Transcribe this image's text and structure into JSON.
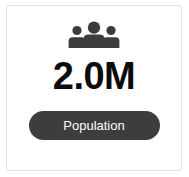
{
  "card": {
    "icon": {
      "name": "people-group-icon",
      "color": "#3c3c3c"
    },
    "value": "2.0M",
    "value_color": "#0c0c0c",
    "badge": {
      "label": "Population",
      "background": "#3d3d3d",
      "text_color": "#ffffff"
    },
    "background": "#ffffff",
    "border_color": "#e3e3e3"
  }
}
